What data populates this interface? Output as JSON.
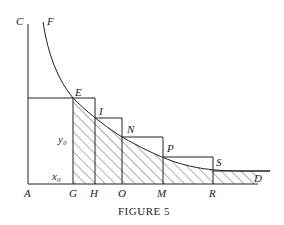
{
  "figure": {
    "caption": "FIGURE 5",
    "point_labels": {
      "C": "C",
      "F": "F",
      "E": "E",
      "I": "I",
      "N": "N",
      "P": "P",
      "S": "S",
      "D": "D",
      "A": "A",
      "G": "G",
      "H": "H",
      "O": "O",
      "M": "M",
      "R": "R"
    },
    "quantity_labels": {
      "y0": "y₀",
      "x0": "x₀"
    },
    "colors": {
      "stroke": "#222222",
      "background": "#ffffff"
    }
  }
}
